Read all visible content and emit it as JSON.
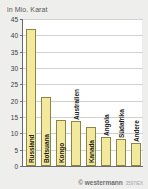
{
  "chart_data": {
    "type": "bar",
    "title": "in Mio. Karat",
    "xlabel": "",
    "ylabel": "",
    "ylim": [
      0,
      45
    ],
    "ytick_step": 5,
    "yticks": [
      45,
      40,
      35,
      30,
      25,
      20,
      15,
      10,
      5,
      0
    ],
    "grid": true,
    "legend": "none",
    "categories": [
      "Russland",
      "Botsuana",
      "Kongo",
      "Australien",
      "Kanada",
      "Angola",
      "Südafrika",
      "Andere"
    ],
    "values": [
      42,
      21,
      14.2,
      13.7,
      12,
      9,
      8.4,
      7
    ],
    "bar_color": "#f2e99c",
    "bar_border_color": "#8d8546",
    "plot_background": "#ffffff",
    "page_background": "#eeeeec",
    "axis_color": "#6c6c6e",
    "grid_color": "#d2d2d0"
  },
  "footer": {
    "credit": "© westermann",
    "code": "3597IEX"
  }
}
